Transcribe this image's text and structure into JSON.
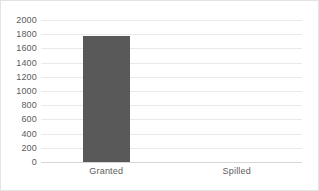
{
  "chart_data": {
    "type": "bar",
    "title": "",
    "subtitle": "",
    "xlabel": "",
    "ylabel": "",
    "categories": [
      "Granted",
      "Spilled"
    ],
    "values": [
      1780,
      0
    ],
    "series": [
      {
        "name": "Series 1",
        "values": [
          1780,
          0
        ]
      }
    ],
    "ylim": [
      0,
      2000
    ],
    "ytick_labels": [
      "2000",
      "1800",
      "1600",
      "1400",
      "1200",
      "1000",
      "800",
      "600",
      "400",
      "200",
      "0"
    ],
    "ytick_values": [
      2000,
      1800,
      1600,
      1400,
      1200,
      1000,
      800,
      600,
      400,
      200,
      0
    ],
    "ytick_step": 200,
    "grid": true,
    "grid_axis": "y",
    "legend": false,
    "legend_position": "none",
    "colors": {
      "bar": "#595959",
      "gridline": "#e9e9e9",
      "baseline": "#d6d6d6",
      "text": "#5b5b5b",
      "border": "#e3e3e3",
      "background": "#ffffff"
    }
  }
}
